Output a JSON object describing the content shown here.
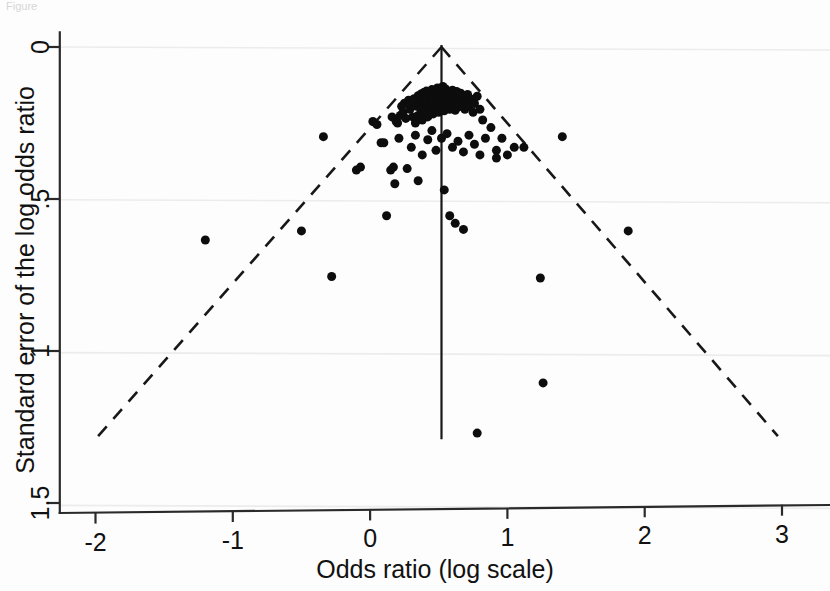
{
  "figure": {
    "title_fragment": "Figure",
    "background_color": "#fdfdfd",
    "point_color": "#0d0d0d",
    "grid_color": "#ececec",
    "axis_color": "#2a2a2a"
  },
  "axes": {
    "x_title": "Odds ratio (log scale)",
    "y_title": "Standard error of the log odds ratio",
    "x_ticks": [
      "-2",
      "-1",
      "0",
      "1",
      "2",
      "3"
    ],
    "y_ticks": [
      "0",
      ".5",
      "1",
      "1.5"
    ]
  },
  "chart_data": {
    "type": "scatter",
    "title": "",
    "subtitle": "",
    "xlabel": "Odds ratio (log scale)",
    "ylabel": "Standard error of the log odds ratio",
    "xlim": [
      -2.26,
      3.34
    ],
    "ylim": [
      1.5,
      -0.015
    ],
    "y_inverted": true,
    "grid": "horizontal",
    "legend": "none",
    "x_tick_values": [
      -2,
      -1,
      0,
      1,
      2,
      3
    ],
    "x_tick_labels": [
      "-2",
      "-1",
      "0",
      "1",
      "2",
      "3"
    ],
    "y_tick_values": [
      0,
      0.5,
      1,
      1.5
    ],
    "y_tick_labels": [
      "0",
      ".5",
      "1",
      "1.5"
    ],
    "annotations": {
      "pooled_effect": 0.52,
      "funnel_apex": {
        "x": 0.52,
        "y": 0.0
      },
      "funnel_left_end": {
        "x": -2.0,
        "y": 1.29
      },
      "funnel_right_end": {
        "x": 2.97,
        "y": 1.28
      },
      "center_line_bottom": {
        "x": 0.52,
        "y": 1.29
      }
    },
    "series": [
      {
        "name": "Studies",
        "marker": "filled-circle",
        "marker_size": 9,
        "color": "#0d0d0d",
        "n_points": 131,
        "points": [
          [
            -1.2,
            0.635
          ],
          [
            -0.5,
            0.605
          ],
          [
            -0.34,
            0.295
          ],
          [
            -0.28,
            0.755
          ],
          [
            -0.1,
            0.405
          ],
          [
            -0.07,
            0.395
          ],
          [
            0.02,
            0.245
          ],
          [
            0.05,
            0.255
          ],
          [
            0.08,
            0.315
          ],
          [
            0.1,
            0.315
          ],
          [
            0.12,
            0.555
          ],
          [
            0.15,
            0.405
          ],
          [
            0.16,
            0.23
          ],
          [
            0.17,
            0.395
          ],
          [
            0.19,
            0.245
          ],
          [
            0.2,
            0.25
          ],
          [
            0.21,
            0.3
          ],
          [
            0.22,
            0.225
          ],
          [
            0.23,
            0.195
          ],
          [
            0.24,
            0.215
          ],
          [
            0.25,
            0.185
          ],
          [
            0.26,
            0.235
          ],
          [
            0.27,
            0.4
          ],
          [
            0.28,
            0.175
          ],
          [
            0.29,
            0.205
          ],
          [
            0.3,
            0.19
          ],
          [
            0.31,
            0.23
          ],
          [
            0.32,
            0.17
          ],
          [
            0.33,
            0.25
          ],
          [
            0.34,
            0.195
          ],
          [
            0.35,
            0.16
          ],
          [
            0.35,
            0.225
          ],
          [
            0.36,
            0.18
          ],
          [
            0.37,
            0.205
          ],
          [
            0.37,
            0.155
          ],
          [
            0.38,
            0.24
          ],
          [
            0.38,
            0.175
          ],
          [
            0.39,
            0.2
          ],
          [
            0.39,
            0.15
          ],
          [
            0.4,
            0.165
          ],
          [
            0.4,
            0.215
          ],
          [
            0.41,
            0.185
          ],
          [
            0.41,
            0.145
          ],
          [
            0.42,
            0.23
          ],
          [
            0.42,
            0.17
          ],
          [
            0.43,
            0.195
          ],
          [
            0.43,
            0.15
          ],
          [
            0.44,
            0.21
          ],
          [
            0.44,
            0.16
          ],
          [
            0.45,
            0.18
          ],
          [
            0.45,
            0.14
          ],
          [
            0.46,
            0.22
          ],
          [
            0.46,
            0.165
          ],
          [
            0.47,
            0.19
          ],
          [
            0.47,
            0.145
          ],
          [
            0.48,
            0.205
          ],
          [
            0.48,
            0.155
          ],
          [
            0.49,
            0.175
          ],
          [
            0.49,
            0.135
          ],
          [
            0.5,
            0.215
          ],
          [
            0.5,
            0.16
          ],
          [
            0.51,
            0.185
          ],
          [
            0.51,
            0.14
          ],
          [
            0.52,
            0.2
          ],
          [
            0.52,
            0.15
          ],
          [
            0.53,
            0.17
          ],
          [
            0.53,
            0.13
          ],
          [
            0.54,
            0.21
          ],
          [
            0.54,
            0.155
          ],
          [
            0.55,
            0.18
          ],
          [
            0.55,
            0.138
          ],
          [
            0.56,
            0.195
          ],
          [
            0.56,
            0.148
          ],
          [
            0.57,
            0.165
          ],
          [
            0.58,
            0.205
          ],
          [
            0.58,
            0.158
          ],
          [
            0.59,
            0.178
          ],
          [
            0.6,
            0.142
          ],
          [
            0.6,
            0.192
          ],
          [
            0.61,
            0.162
          ],
          [
            0.62,
            0.208
          ],
          [
            0.63,
            0.172
          ],
          [
            0.63,
            0.146
          ],
          [
            0.64,
            0.198
          ],
          [
            0.65,
            0.168
          ],
          [
            0.66,
            0.152
          ],
          [
            0.67,
            0.188
          ],
          [
            0.68,
            0.164
          ],
          [
            0.69,
            0.205
          ],
          [
            0.7,
            0.178
          ],
          [
            0.71,
            0.156
          ],
          [
            0.72,
            0.196
          ],
          [
            0.74,
            0.172
          ],
          [
            0.75,
            0.215
          ],
          [
            0.76,
            0.186
          ],
          [
            0.78,
            0.162
          ],
          [
            0.8,
            0.205
          ],
          [
            0.82,
            0.24
          ],
          [
            0.3,
            0.33
          ],
          [
            0.33,
            0.29
          ],
          [
            0.38,
            0.355
          ],
          [
            0.42,
            0.305
          ],
          [
            0.45,
            0.275
          ],
          [
            0.48,
            0.34
          ],
          [
            0.52,
            0.3
          ],
          [
            0.56,
            0.285
          ],
          [
            0.6,
            0.33
          ],
          [
            0.64,
            0.31
          ],
          [
            0.68,
            0.345
          ],
          [
            0.72,
            0.29
          ],
          [
            0.76,
            0.32
          ],
          [
            0.8,
            0.355
          ],
          [
            0.84,
            0.3
          ],
          [
            0.88,
            0.265
          ],
          [
            0.92,
            0.34
          ],
          [
            0.96,
            0.3
          ],
          [
            1.0,
            0.355
          ],
          [
            1.05,
            0.33
          ],
          [
            0.18,
            0.45
          ],
          [
            0.35,
            0.44
          ],
          [
            0.54,
            0.47
          ],
          [
            0.58,
            0.555
          ],
          [
            0.62,
            0.58
          ],
          [
            0.68,
            0.6
          ],
          [
            0.92,
            0.365
          ],
          [
            1.12,
            0.33
          ],
          [
            1.4,
            0.295
          ],
          [
            1.88,
            0.605
          ],
          [
            1.24,
            0.76
          ],
          [
            1.26,
            1.105
          ],
          [
            0.78,
            1.27
          ]
        ]
      }
    ]
  }
}
